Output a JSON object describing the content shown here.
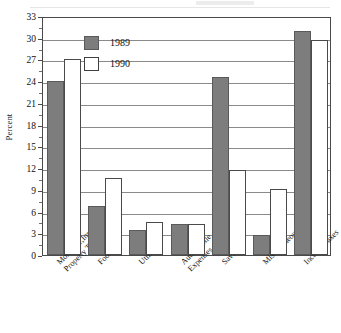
{
  "chart_data": {
    "type": "bar",
    "title": "",
    "subtitle": "",
    "xlabel": "",
    "ylabel": "Percent",
    "ylim": [
      0,
      33
    ],
    "ytick_step": 3,
    "yticks": [
      0,
      3,
      6,
      9,
      12,
      15,
      18,
      21,
      24,
      27,
      30,
      33
    ],
    "grid": true,
    "legend_position": "upper-left-inside",
    "categories": [
      "Mortgage,Insurance, Property Taxes",
      "Food",
      "Utilities",
      "Automobile Expenses",
      "Savings",
      "Miscellaneous",
      "Income Taxes"
    ],
    "category_lines": [
      [
        "Mortgage,Insurance,",
        "Property Taxes"
      ],
      [
        "Food",
        ""
      ],
      [
        "Utilities",
        ""
      ],
      [
        "Automobile",
        "Expenses"
      ],
      [
        "Savings",
        ""
      ],
      [
        "Miscellaneous",
        ""
      ],
      [
        "Income Taxes",
        ""
      ]
    ],
    "series": [
      {
        "name": "1989",
        "color": "#7d7d7d",
        "values": [
          24.0,
          6.7,
          3.4,
          4.3,
          24.6,
          2.8,
          31.0
        ]
      },
      {
        "name": "1990",
        "color": "#ffffff",
        "values": [
          27.0,
          10.7,
          4.5,
          4.3,
          11.8,
          9.1,
          29.7
        ]
      }
    ]
  },
  "legend": {
    "entries": [
      {
        "label": "1989"
      },
      {
        "label": "1990"
      }
    ]
  },
  "axis": {
    "y_title": "Percent"
  },
  "colors": {
    "series_1989": "#7d7d7d",
    "series_1990": "#ffffff",
    "frame": "#4a4a4a",
    "grid": "#8a8a8a",
    "text": "#101010",
    "background": "#ffffff"
  }
}
